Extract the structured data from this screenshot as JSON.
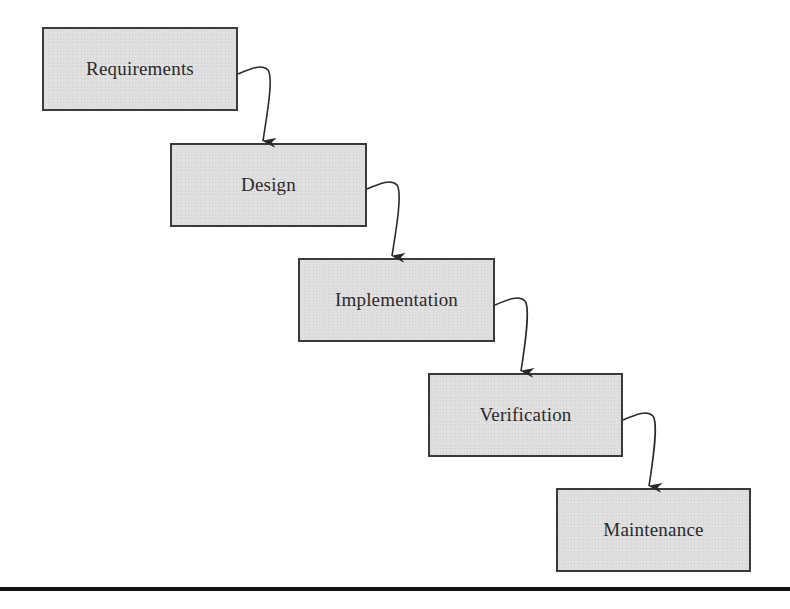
{
  "diagram": {
    "type": "waterfall-process",
    "phases": [
      {
        "label": "Requirements",
        "x": 42,
        "y": 27,
        "w": 196,
        "h": 84
      },
      {
        "label": "Design",
        "x": 170,
        "y": 143,
        "w": 197,
        "h": 84
      },
      {
        "label": "Implementation",
        "x": 298,
        "y": 258,
        "w": 197,
        "h": 84
      },
      {
        "label": "Verification",
        "x": 428,
        "y": 373,
        "w": 195,
        "h": 84
      },
      {
        "label": "Maintenance",
        "x": 556,
        "y": 488,
        "w": 195,
        "h": 84
      }
    ],
    "connectors": [
      {
        "from": "Requirements",
        "to": "Design"
      },
      {
        "from": "Design",
        "to": "Implementation"
      },
      {
        "from": "Implementation",
        "to": "Verification"
      },
      {
        "from": "Verification",
        "to": "Maintenance"
      }
    ],
    "colors": {
      "box_fill": "#dedede",
      "box_border": "#3a3a3a",
      "text": "#2a2a2a",
      "arrow": "#2a2a2a",
      "rule": "#111111"
    }
  }
}
